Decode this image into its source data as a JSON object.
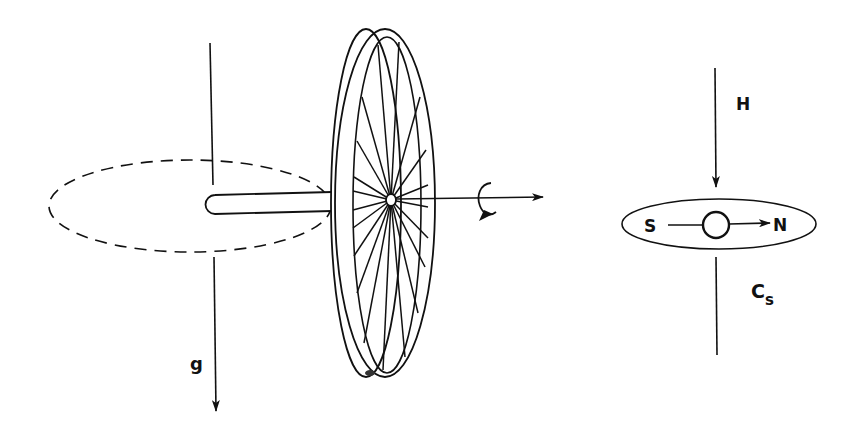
{
  "diagram": {
    "left_figure": {
      "name": "spinning bicycle wheel gyroscope",
      "gravity_label": "g",
      "rotation_symbol": "rotation-arrow"
    },
    "right_figure": {
      "name": "compass needle in field",
      "field_label": "H",
      "south_label": "S",
      "north_label": "N",
      "system_label_main": "C",
      "system_label_sub": "s"
    },
    "colors": {
      "stroke": "#111111",
      "background": "#ffffff"
    }
  }
}
